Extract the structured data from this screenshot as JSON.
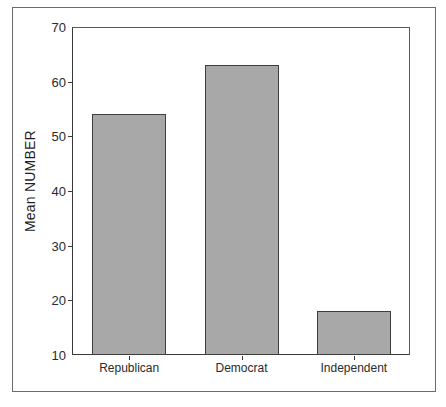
{
  "chart_data": {
    "type": "bar",
    "title": "",
    "xlabel": "",
    "ylabel": "Mean NUMBER",
    "categories": [
      "Republican",
      "Democrat",
      "Independent"
    ],
    "values": [
      54,
      63,
      18
    ],
    "ylim": [
      10,
      70
    ],
    "yticks": [
      10,
      20,
      30,
      40,
      50,
      60,
      70
    ],
    "ytick_labels": [
      "10",
      "20",
      "30",
      "40",
      "50",
      "60",
      "70"
    ],
    "grid": false,
    "legend": "none",
    "bar_fill_color": "#a8a8a8",
    "bar_border_color": "#3d3d3d",
    "axis_color": "#3a3a3a",
    "frame_color": "#6b6b6b",
    "background_color": "#ffffff"
  }
}
